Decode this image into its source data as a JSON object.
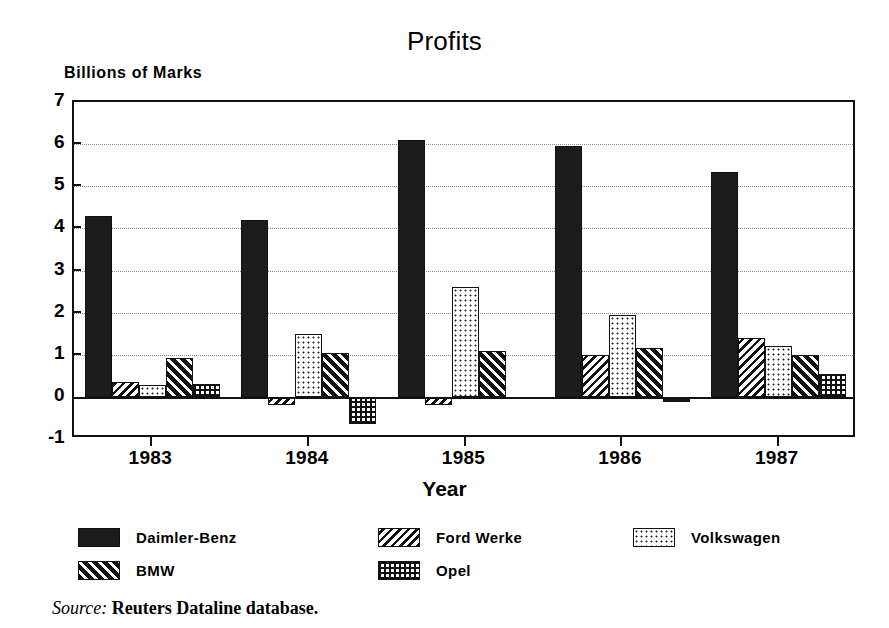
{
  "chart_data": {
    "type": "bar",
    "title": "Profits",
    "xlabel": "Year",
    "ylabel": "Billions of Marks",
    "categories": [
      "1983",
      "1984",
      "1985",
      "1986",
      "1987"
    ],
    "ylim": [
      -1,
      7
    ],
    "yticks": [
      7,
      6,
      5,
      4,
      3,
      2,
      1,
      0,
      -1
    ],
    "ytick_labels": [
      "7",
      "6",
      "5",
      "4",
      "3",
      "2",
      "1",
      "0",
      "-1"
    ],
    "grid": true,
    "grid_axis": "y",
    "legend_position": "below-plot",
    "series": [
      {
        "name": "Daimler-Benz",
        "pattern": "solid-black",
        "values": [
          4.3,
          4.2,
          6.1,
          5.95,
          5.35
        ]
      },
      {
        "name": "Ford Werke",
        "pattern": "back-diagonal-hatch",
        "values": [
          0.35,
          -0.2,
          -0.2,
          1.0,
          1.4
        ]
      },
      {
        "name": "Volkswagen",
        "pattern": "light-dots",
        "values": [
          0.28,
          1.5,
          2.6,
          1.95,
          1.2
        ]
      },
      {
        "name": "BMW",
        "pattern": "forward-diagonal-hatch",
        "values": [
          0.92,
          1.05,
          1.1,
          1.15,
          1.0
        ]
      },
      {
        "name": "Opel",
        "pattern": "grid-dots",
        "values": [
          0.3,
          -0.65,
          -0.05,
          -0.12,
          0.55
        ]
      }
    ]
  },
  "legend": {
    "entries": [
      {
        "label": "Daimler-Benz",
        "pattern": "solid-black"
      },
      {
        "label": "Ford Werke",
        "pattern": "back-diagonal-hatch"
      },
      {
        "label": "Volkswagen",
        "pattern": "light-dots"
      },
      {
        "label": "BMW",
        "pattern": "forward-diagonal-hatch"
      },
      {
        "label": "Opel",
        "pattern": "grid-dots"
      }
    ]
  },
  "source": {
    "lead": "Source:",
    "text": " Reuters Dataline database."
  },
  "colors": {
    "ink": "#111111",
    "bar_fill_solid": "#1c1c1c",
    "background": "#ffffff",
    "gridline": "#8a8a8a"
  }
}
